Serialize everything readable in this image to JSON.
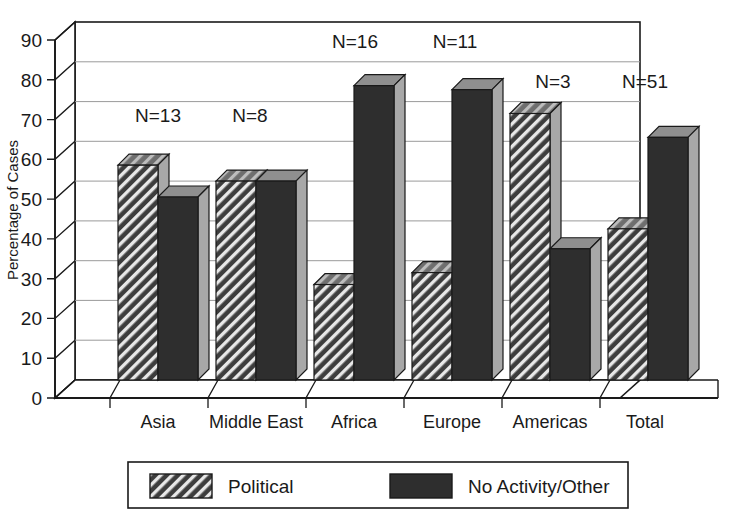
{
  "chart_data": {
    "type": "bar",
    "title": "",
    "subtitle": "",
    "xlabel": "",
    "ylabel": "Percentage of Cases",
    "ylim": [
      0,
      90
    ],
    "ytick_step": 10,
    "yticks": [
      0,
      10,
      20,
      30,
      40,
      50,
      60,
      70,
      80,
      90
    ],
    "ytick_labels": [
      "0",
      "10",
      "20",
      "30",
      "40",
      "50",
      "60",
      "70",
      "80",
      "90"
    ],
    "grid": true,
    "grid_axis": "y",
    "legend_position": "bottom",
    "style": "3d-bars",
    "categories": [
      "Asia",
      "Middle East",
      "Africa",
      "Europe",
      "Americas",
      "Total"
    ],
    "series": [
      {
        "name": "Political",
        "fill": "hatched",
        "color": "#3a3a3a",
        "values": [
          54,
          50,
          24,
          27,
          67,
          38
        ]
      },
      {
        "name": "No Activity/Other",
        "fill": "solid",
        "color": "#2e2e2e",
        "values": [
          46,
          50,
          74,
          73,
          33,
          61
        ]
      }
    ],
    "annotations": [
      {
        "text": "N=13",
        "category": "Asia"
      },
      {
        "text": "N=8",
        "category": "Middle East"
      },
      {
        "text": "N=16",
        "category": "Africa"
      },
      {
        "text": "N=11",
        "category": "Europe"
      },
      {
        "text": "N=3",
        "category": "Americas"
      },
      {
        "text": "N=51",
        "category": "Total"
      }
    ]
  },
  "axis": {
    "y_title": "Percentage of Cases",
    "tick_0": "0",
    "tick_10": "10",
    "tick_20": "20",
    "tick_30": "30",
    "tick_40": "40",
    "tick_50": "50",
    "tick_60": "60",
    "tick_70": "70",
    "tick_80": "80",
    "tick_90": "90"
  },
  "categories": {
    "c0": "Asia",
    "c1": "Middle East",
    "c2": "Africa",
    "c3": "Europe",
    "c4": "Americas",
    "c5": "Total"
  },
  "annotations": {
    "n0": "N=13",
    "n1": "N=8",
    "n2": "N=16",
    "n3": "N=11",
    "n4": "N=3",
    "n5": "N=51"
  },
  "legend": {
    "item0_label": "Political",
    "item1_label": "No Activity/Other"
  },
  "colors": {
    "bar_front_dark": "#2e2e2e",
    "bar_front_hatch_bg": "#3d3d3d",
    "bar_top": "#8f8f8f",
    "bar_side": "#a8a8a8",
    "axis": "#1a1a1a",
    "grid": "#9a9a9a",
    "background": "#ffffff"
  }
}
